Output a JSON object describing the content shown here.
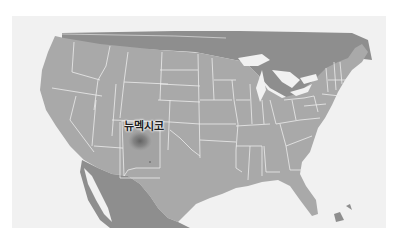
{
  "map": {
    "region": "United States",
    "style": "grayscale",
    "colors": {
      "page_background": "#ffffff",
      "ocean": "#f1f1f1",
      "land_us": "#a9a9a9",
      "land_foreign": "#8e8e8e",
      "borders": "#e8e8e8",
      "highlight_blob": "#6f6f6f",
      "label_text": "#222222"
    },
    "highlight": {
      "state": "New Mexico",
      "label": "뉴멕시코"
    }
  }
}
